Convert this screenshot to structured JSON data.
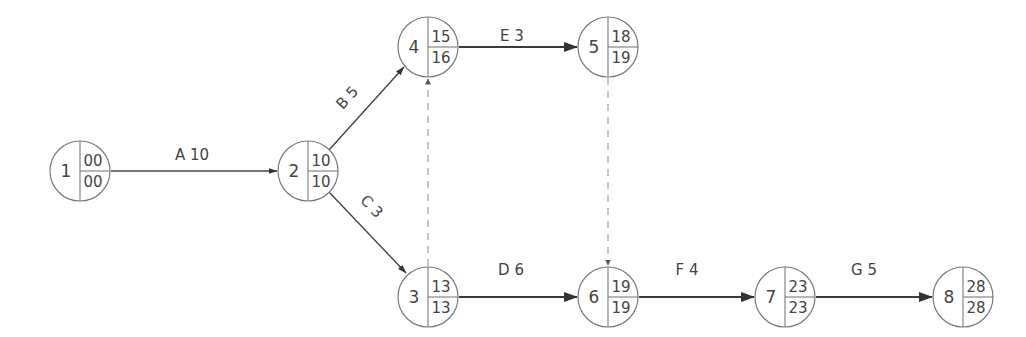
{
  "diagram": {
    "type": "activity-on-arrow network",
    "nodes": [
      {
        "id": "1",
        "early": "00",
        "late": "00",
        "cx": 80,
        "cy": 171
      },
      {
        "id": "2",
        "early": "10",
        "late": "10",
        "cx": 308,
        "cy": 171
      },
      {
        "id": "3",
        "early": "13",
        "late": "13",
        "cx": 428,
        "cy": 297
      },
      {
        "id": "4",
        "early": "15",
        "late": "16",
        "cx": 428,
        "cy": 47
      },
      {
        "id": "5",
        "early": "18",
        "late": "19",
        "cx": 608,
        "cy": 47
      },
      {
        "id": "6",
        "early": "19",
        "late": "19",
        "cx": 608,
        "cy": 297
      },
      {
        "id": "7",
        "early": "23",
        "late": "23",
        "cx": 785,
        "cy": 297
      },
      {
        "id": "8",
        "early": "28",
        "late": "28",
        "cx": 963,
        "cy": 297
      }
    ],
    "activities": [
      {
        "from": "1",
        "to": "2",
        "label": "A 10",
        "activity": "A",
        "duration": 10
      },
      {
        "from": "2",
        "to": "4",
        "label": "B 5",
        "activity": "B",
        "duration": 5
      },
      {
        "from": "2",
        "to": "3",
        "label": "C 3",
        "activity": "C",
        "duration": 3
      },
      {
        "from": "3",
        "to": "6",
        "label": "D 6",
        "activity": "D",
        "duration": 6
      },
      {
        "from": "4",
        "to": "5",
        "label": "E 3",
        "activity": "E",
        "duration": 3
      },
      {
        "from": "6",
        "to": "7",
        "label": "F 4",
        "activity": "F",
        "duration": 4
      },
      {
        "from": "7",
        "to": "8",
        "label": "G 5",
        "activity": "G",
        "duration": 5
      }
    ],
    "dummies": [
      {
        "from": "3",
        "to": "4"
      },
      {
        "from": "5",
        "to": "6"
      }
    ],
    "colors": {
      "line": "#3a3a3a",
      "circle": "#7a7a7a",
      "text": "#444444",
      "dummy": "#8a8a8a"
    }
  }
}
